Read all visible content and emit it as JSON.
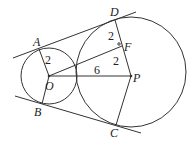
{
  "diagram": {
    "type": "geometry",
    "circles": [
      {
        "center": "O",
        "radius_label": "2"
      },
      {
        "center": "P",
        "radius_label": "6"
      }
    ],
    "points": {
      "A": "A",
      "B": "B",
      "C": "C",
      "D": "D",
      "O": "O",
      "P": "P",
      "F": "F"
    },
    "segment_labels": {
      "OA": "2",
      "DF": "2",
      "FP": "2",
      "OP": "6"
    }
  }
}
